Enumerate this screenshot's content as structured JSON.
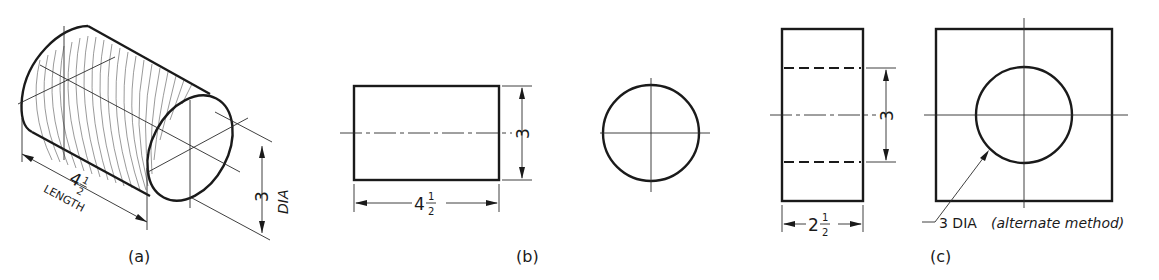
{
  "figure": {
    "panels": [
      {
        "id": "a",
        "caption": "(a)",
        "view": "isometric pictorial of cylinder",
        "length_whole": "4",
        "length_num": "1",
        "length_den": "2",
        "length_label": "LENGTH",
        "diameter_value": "3",
        "diameter_label": "DIA"
      },
      {
        "id": "b",
        "caption": "(b)",
        "view": "two views: rectangular side view and circular end view",
        "length_whole": "4",
        "length_num": "1",
        "length_den": "2",
        "height_value": "3"
      },
      {
        "id": "c",
        "caption": "(c)",
        "view": "side view with hidden lines and front view with circular hole",
        "width_whole": "2",
        "width_num": "1",
        "width_den": "2",
        "hole_value": "3",
        "note_main": "3 DIA",
        "note_italic": "(alternate method)"
      }
    ]
  },
  "colors": {
    "line": "#1a1a1a",
    "background": "#ffffff"
  }
}
